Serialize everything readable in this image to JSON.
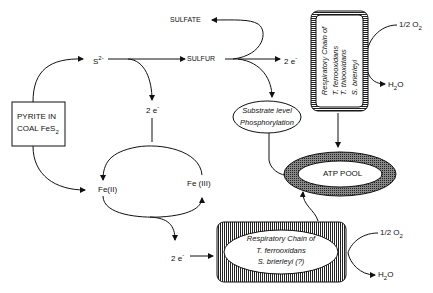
{
  "nodes": {
    "pyrite": {
      "line1": "PYRITE IN",
      "line2": "COAL FeS",
      "sub": "2"
    },
    "sulfide": {
      "base": "S",
      "sup": "2-"
    },
    "sulfur": "SULFUR",
    "sulfate": "SULFATE",
    "electrons_top_mid": {
      "base": "2 e",
      "sup": "-"
    },
    "electrons_top_right": {
      "base": "2 e",
      "sup": "-"
    },
    "electrons_bottom": {
      "base": "2 e",
      "sup": "-"
    },
    "fe2": "Fe(II)",
    "fe3": "Fe (III)",
    "substrate": {
      "line1": "Substrate level",
      "line2": "Phosphorylation"
    },
    "atp_pool": "ATP POOL",
    "resp_top": {
      "line1": "Respiratory Chain of",
      "line2": "T. ferrooxidans",
      "line3": "T. thiooxidans",
      "line4": "S. brierleyi"
    },
    "resp_bottom": {
      "line1": "Respiratory Chain of",
      "line2": "T. ferrooxidans",
      "line3": "S. brierleyi (?)"
    },
    "o2_top": {
      "base": "1/2 O",
      "sub": "2"
    },
    "h2o_top": {
      "base": "H",
      "sub": "2",
      "tail": "O"
    },
    "o2_bottom": {
      "base": "1/2 O",
      "sub": "2"
    },
    "h2o_bottom": {
      "base": "H",
      "sub": "2",
      "tail": "O"
    }
  }
}
